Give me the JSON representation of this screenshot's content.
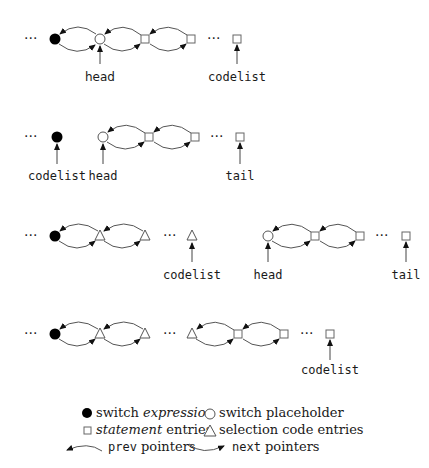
{
  "diagram": {
    "ellipsis": "···",
    "rows": [
      {
        "id": "row1",
        "labels": [
          {
            "text": "head",
            "x": 100
          },
          {
            "text": "codelist",
            "x": 237
          }
        ]
      },
      {
        "id": "row2",
        "labels": [
          {
            "text": "codelist",
            "x": 57
          },
          {
            "text": "head",
            "x": 103
          },
          {
            "text": "tail",
            "x": 240
          }
        ]
      },
      {
        "id": "row3",
        "labels": [
          {
            "text": "codelist",
            "x": 192
          },
          {
            "text": "head",
            "x": 268
          },
          {
            "text": "tail",
            "x": 406
          }
        ]
      },
      {
        "id": "row4",
        "labels": [
          {
            "text": "codelist",
            "x": 330
          }
        ]
      }
    ]
  },
  "legend": {
    "switch_expression": {
      "prefix": "switch ",
      "emph": "expression"
    },
    "switch_placeholder": "switch placeholder",
    "statement_entries": {
      "emph": "statement",
      "suffix": " entries"
    },
    "selection_code_entries": "selection code entries",
    "prev_pointers": {
      "code": "prev",
      "suffix": " pointers"
    },
    "next_pointers": {
      "code": "next",
      "suffix": " pointers"
    }
  }
}
